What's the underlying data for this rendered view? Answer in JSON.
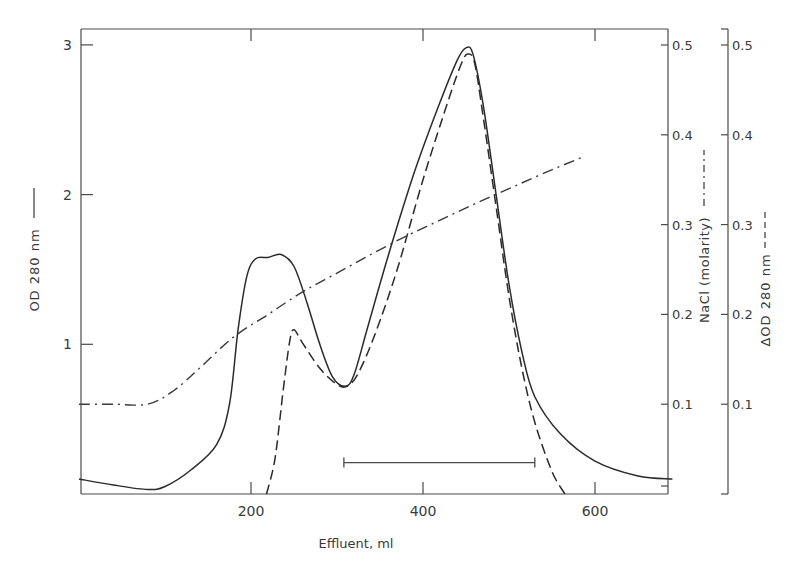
{
  "chart_data": {
    "type": "line",
    "title": "",
    "xlabel": "Effluent, ml",
    "ylabel": "OD 280 nm",
    "ylabel_legend": "solid",
    "y2label": "NaCl (molarity)",
    "y2label_legend": "dash-dot",
    "y3label": "ΔOD 280 nm",
    "y3label_legend": "dashed",
    "xlim": [
      0,
      690
    ],
    "ylim": [
      0,
      3
    ],
    "y2lim": [
      0,
      0.5
    ],
    "y3lim": [
      0,
      0.5
    ],
    "x_ticks": [
      200,
      400,
      600
    ],
    "x_tick_labels": [
      "200",
      "400",
      "600"
    ],
    "y_ticks": [
      1,
      2,
      3
    ],
    "y_tick_labels": [
      "1",
      "2",
      "3"
    ],
    "y2_ticks": [
      0.1,
      0.2,
      0.3,
      0.4,
      0.5
    ],
    "y2_tick_labels": [
      "0.1",
      "0.2",
      "0.3",
      "0.4",
      "0.5"
    ],
    "y3_ticks": [
      0.1,
      0.2,
      0.3,
      0.4,
      0.5
    ],
    "y3_tick_labels": [
      "0.1",
      "0.2",
      "0.3",
      "0.4",
      "0.5"
    ],
    "grid": false,
    "series": [
      {
        "name": "OD 280 nm",
        "axis": "left",
        "style": "solid",
        "x": [
          0,
          40,
          80,
          100,
          130,
          160,
          175,
          185,
          195,
          205,
          220,
          235,
          250,
          265,
          280,
          295,
          310,
          320,
          335,
          360,
          390,
          420,
          440,
          450,
          458,
          470,
          485,
          500,
          515,
          530,
          560,
          600,
          650,
          690
        ],
        "y": [
          0.1,
          0.06,
          0.03,
          0.05,
          0.16,
          0.33,
          0.6,
          1.1,
          1.45,
          1.57,
          1.58,
          1.6,
          1.52,
          1.28,
          1.0,
          0.78,
          0.72,
          0.8,
          1.1,
          1.6,
          2.15,
          2.62,
          2.9,
          2.98,
          2.94,
          2.6,
          2.0,
          1.4,
          0.95,
          0.65,
          0.4,
          0.22,
          0.12,
          0.1
        ]
      },
      {
        "name": "ΔOD 280 nm",
        "axis": "right2",
        "style": "dashed",
        "x": [
          218,
          228,
          238,
          245,
          250,
          260,
          280,
          300,
          312,
          325,
          345,
          370,
          400,
          430,
          445,
          452,
          460,
          470,
          485,
          500,
          515,
          530,
          550,
          565
        ],
        "y": [
          0.0,
          0.04,
          0.12,
          0.17,
          0.183,
          0.168,
          0.14,
          0.122,
          0.12,
          0.135,
          0.18,
          0.25,
          0.35,
          0.44,
          0.48,
          0.49,
          0.48,
          0.42,
          0.32,
          0.22,
          0.14,
          0.08,
          0.025,
          0.0
        ]
      },
      {
        "name": "NaCl (molarity)",
        "axis": "right1",
        "style": "dash-dot",
        "x": [
          0,
          40,
          80,
          110,
          140,
          180,
          220,
          260,
          300,
          340,
          380,
          420,
          460,
          500,
          540,
          585
        ],
        "y": [
          0.1,
          0.1,
          0.1,
          0.115,
          0.14,
          0.175,
          0.2,
          0.225,
          0.246,
          0.267,
          0.287,
          0.305,
          0.323,
          0.34,
          0.357,
          0.375
        ]
      }
    ],
    "annotations": [
      {
        "type": "horizontal-bar",
        "label": "pooled fractions",
        "x_start": 308,
        "x_end": 530,
        "y_od": 0.21
      }
    ]
  },
  "labels": {
    "x_axis_title": "Effluent, ml",
    "y_left_title": "OD 280 nm",
    "y_right1_title": "NaCl (molarity)",
    "y_right2_title": "ΔOD 280 nm"
  }
}
